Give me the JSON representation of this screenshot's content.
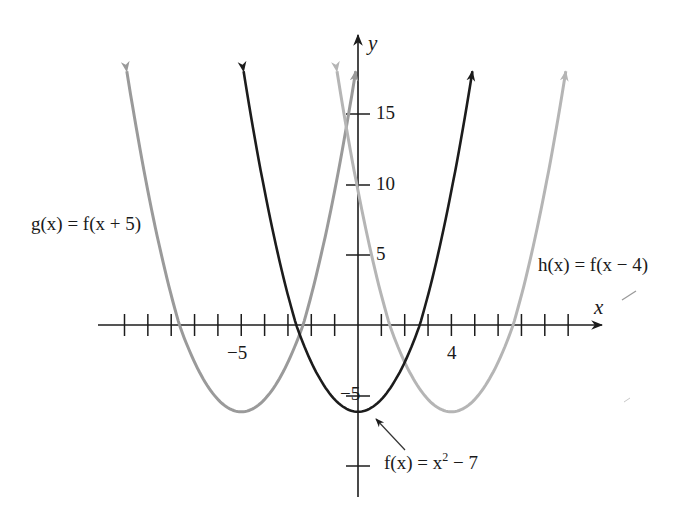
{
  "chart_data": {
    "type": "line",
    "title": "",
    "xlabel": "x",
    "ylabel": "y",
    "xlim": [
      -10.5,
      10.5
    ],
    "ylim": [
      -12,
      21
    ],
    "grid": false,
    "x_ticks_every": 1,
    "y_ticks": [
      -10,
      -5,
      5,
      10,
      15
    ],
    "x_tick_labels": [
      {
        "value": -5,
        "label": "−5"
      },
      {
        "value": 4,
        "label": "4"
      }
    ],
    "y_tick_labels": [
      {
        "value": 15,
        "label": "15"
      },
      {
        "value": 10,
        "label": "10"
      },
      {
        "value": 5,
        "label": "5"
      },
      {
        "value": -5,
        "label": "−5"
      }
    ],
    "series": [
      {
        "name": "f(x) = x^2 − 7",
        "expression": "x^2 - 7",
        "shift": 0,
        "color": "#1c1c1c",
        "vertex": [
          0,
          -7
        ],
        "x_range": [
          -4.9,
          4.9
        ],
        "arrows": "both_ends"
      },
      {
        "name": "g(x) = f(x + 5)",
        "expression": "(x+5)^2 - 7",
        "shift": -5,
        "color": "#9a9a9a",
        "vertex": [
          -5,
          -7
        ],
        "x_range": [
          -9.9,
          -0.1
        ],
        "arrows": "both_ends"
      },
      {
        "name": "h(x) = f(x − 4)",
        "expression": "(x-4)^2 - 7",
        "shift": 4,
        "color": "#b5b5b5",
        "vertex": [
          4,
          -7
        ],
        "x_range": [
          -0.9,
          8.9
        ],
        "arrows": "both_ends"
      }
    ],
    "annotations": [
      {
        "text": "f(x) = x² − 7",
        "points_to": [
          0.9,
          -6.2
        ],
        "arrow": true
      },
      {
        "text": "g(x) = f(x + 5)",
        "near": "left branch of g"
      },
      {
        "text": "h(x) = f(x − 4)",
        "near": "right branch of h"
      }
    ]
  },
  "labels": {
    "x_axis": "x",
    "y_axis": "y",
    "tick_neg5_x": "−5",
    "tick_4_x": "4",
    "tick_15_y": "15",
    "tick_10_y": "10",
    "tick_5_y": "5",
    "tick_neg5_y": "−5",
    "g_label_pre": "g(x) = f(x + 5)",
    "h_label": "h(x) = f(x − 4)",
    "f_label_pre": "f(x) = x",
    "f_label_sup": "2",
    "f_label_post": " − 7"
  }
}
